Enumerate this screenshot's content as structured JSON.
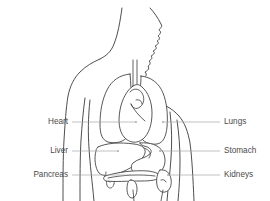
{
  "diagram": {
    "view": "anterior profile",
    "colors": {
      "background": "#ffffff",
      "outline_stroke": "#3a3a3a",
      "organ_stroke": "#3a3a3a",
      "organ_fill": "#ffffff",
      "leader_line": "#a8a8a8",
      "label_text": "#4a4a4a"
    },
    "labels_left": [
      {
        "text": "Heart",
        "x": 68,
        "y": 122,
        "leader_from": 72,
        "leader_to": 136
      },
      {
        "text": "Liver",
        "x": 68,
        "y": 151,
        "leader_from": 72,
        "leader_to": 118
      },
      {
        "text": "Pancreas",
        "x": 68,
        "y": 175,
        "leader_from": 72,
        "leader_to": 130
      }
    ],
    "labels_right": [
      {
        "text": "Lungs",
        "x": 224,
        "y": 122,
        "leader_from": 220,
        "leader_to": 163
      },
      {
        "text": "Stomach",
        "x": 224,
        "y": 151,
        "leader_from": 220,
        "leader_to": 160
      },
      {
        "text": "Kidneys",
        "x": 224,
        "y": 175,
        "leader_from": 220,
        "leader_to": 168
      }
    ],
    "organs": [
      {
        "name": "heart",
        "side": "center"
      },
      {
        "name": "lungs",
        "side": "both"
      },
      {
        "name": "liver",
        "side": "left"
      },
      {
        "name": "stomach",
        "side": "right"
      },
      {
        "name": "pancreas",
        "side": "center"
      },
      {
        "name": "kidneys",
        "side": "right"
      },
      {
        "name": "trachea",
        "side": "center"
      }
    ]
  }
}
